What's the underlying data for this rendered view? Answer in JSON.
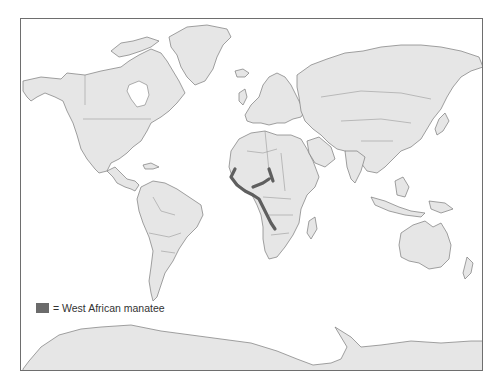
{
  "map": {
    "type": "world-map",
    "projection": "equirectangular-like",
    "colors": {
      "land": "#e6e6e6",
      "outline": "#7a7a7a",
      "water": "#ffffff",
      "range_highlight": "#6b6b6b",
      "frame": "#6e6e6e"
    },
    "highlighted_region": "West African coast (Senegal to Angola) and river systems"
  },
  "legend": {
    "items": [
      {
        "symbol": "=",
        "label": "West African manatee",
        "color": "#6b6b6b"
      }
    ]
  }
}
